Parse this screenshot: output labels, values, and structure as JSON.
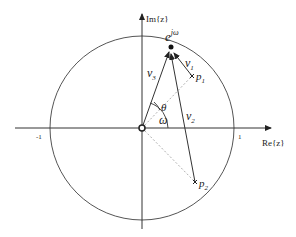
{
  "diagram": {
    "axes": {
      "real_label": "Re{z}",
      "imag_label": "Im{z}",
      "tick_neg_one": "-1",
      "tick_pos_one": "1"
    },
    "points": {
      "unit_point": "e",
      "unit_point_sup": "jω",
      "pole1": "p",
      "pole1_sub": "1",
      "pole2": "p",
      "pole2_sub": "2"
    },
    "vectors": {
      "v1": "v",
      "v1_sub": "1",
      "v2": "v",
      "v2_sub": "2",
      "v3": "v",
      "v3_sub": "3"
    },
    "angles": {
      "theta": "θ",
      "omega": "ω"
    },
    "colors": {
      "line": "#333333",
      "dashed": "#999999",
      "circle": "#555555"
    }
  }
}
